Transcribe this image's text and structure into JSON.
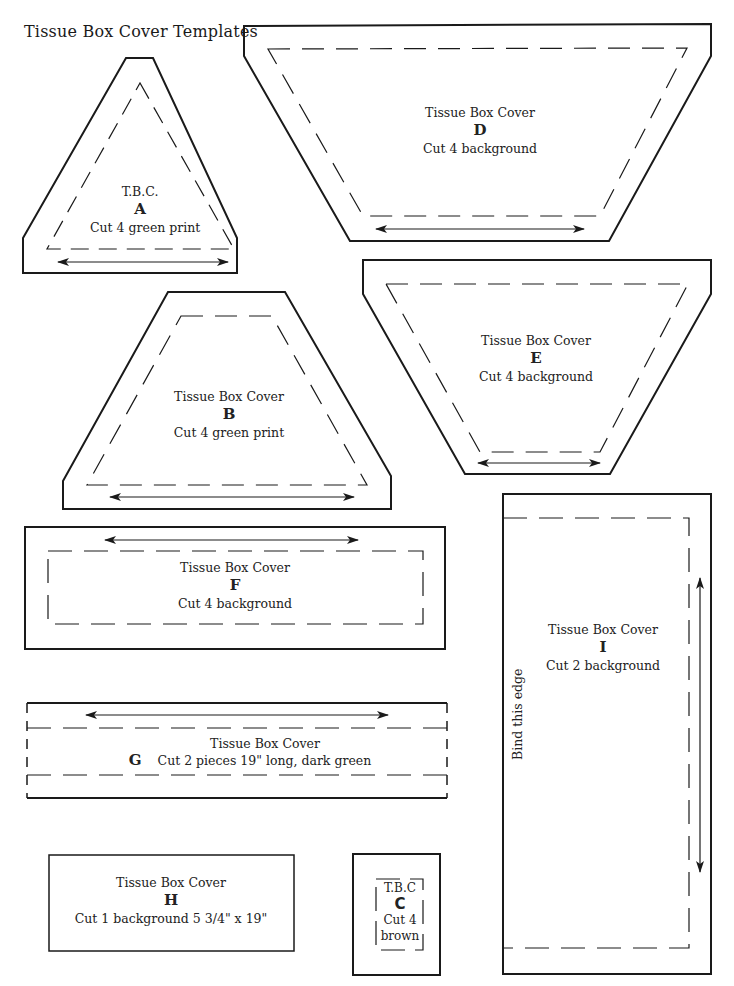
{
  "page": {
    "title": "Tissue Box Cover Templates"
  },
  "templates": {
    "A": {
      "line1": "T.B.C.",
      "letter": "A",
      "line2": "Cut 4 green print"
    },
    "B": {
      "line1": "Tissue Box Cover",
      "letter": "B",
      "line2": "Cut 4 green print"
    },
    "C": {
      "line1": "T.B.C",
      "letter": "C",
      "line2": "Cut 4",
      "line3": "brown"
    },
    "D": {
      "line1": "Tissue Box Cover",
      "letter": "D",
      "line2": "Cut 4 background"
    },
    "E": {
      "line1": "Tissue Box Cover",
      "letter": "E",
      "line2": "Cut 4 background"
    },
    "F": {
      "line1": "Tissue Box Cover",
      "letter": "F",
      "line2": "Cut 4 background"
    },
    "G": {
      "line1": "Tissue Box Cover",
      "letter": "G",
      "line2": "Cut 2 pieces 19\" long, dark green"
    },
    "H": {
      "line1": "Tissue Box Cover",
      "letter": "H",
      "line2": "Cut 1 background 5 3/4\" x 19\""
    },
    "I": {
      "line1": "Tissue Box Cover",
      "letter": "I",
      "line2": "Cut 2 background",
      "edge_note": "Bind this edge"
    }
  },
  "colors": {
    "line": "#1a1a1a",
    "background": "#ffffff"
  }
}
